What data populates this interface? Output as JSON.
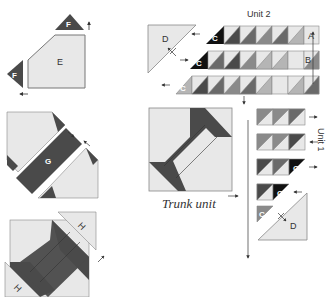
{
  "diagram": {
    "colors": {
      "light": "#e8e8e8",
      "dark": "#4a4a4a",
      "black": "#111111",
      "mid": "#8a8a8a",
      "midlight": "#b5b5b5",
      "outline": "#777777",
      "arrow": "#333333"
    },
    "pieces": {
      "E": "E",
      "F": "F",
      "G": "G",
      "H": "H",
      "A": "A",
      "B": "B",
      "C": "C",
      "D": "D"
    },
    "labels": {
      "unit1": "Unit 1",
      "unit2": "Unit 2",
      "trunk_unit": "Trunk unit"
    },
    "steps": [
      {
        "id": "step-1",
        "description": "Sew F triangles to corners of E"
      },
      {
        "id": "step-2",
        "description": "Sew G strip between two E/F units"
      },
      {
        "id": "step-3",
        "description": "Add H triangles to complete trunk unit"
      }
    ],
    "unit2_rows": [
      {
        "row": 1,
        "end_label": "A",
        "start_label": "C"
      },
      {
        "row": 2,
        "end_label": "B",
        "start_label": "C"
      },
      {
        "row": 3,
        "start_label": "C"
      }
    ],
    "unit1_rows": [
      {
        "row": 1,
        "cells": 3
      },
      {
        "row": 2,
        "cells": 3
      },
      {
        "row": 3,
        "cells": 3,
        "end_label": "C"
      },
      {
        "row": 4,
        "cells": 2,
        "end_label": "C"
      },
      {
        "row": 5,
        "cells": 1,
        "label": "C"
      }
    ]
  }
}
